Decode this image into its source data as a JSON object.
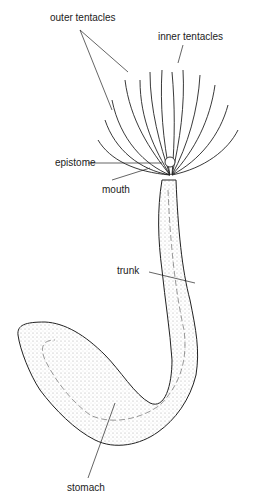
{
  "diagram": {
    "labels": {
      "outer_tentacles": "outer tentacles",
      "inner_tentacles": "inner tentacles",
      "epistome": "epistome",
      "mouth": "mouth",
      "trunk": "trunk",
      "stomach": "stomach"
    },
    "colors": {
      "ink": "#222222",
      "background": "#ffffff",
      "stipple": "#dcdcdc"
    }
  }
}
